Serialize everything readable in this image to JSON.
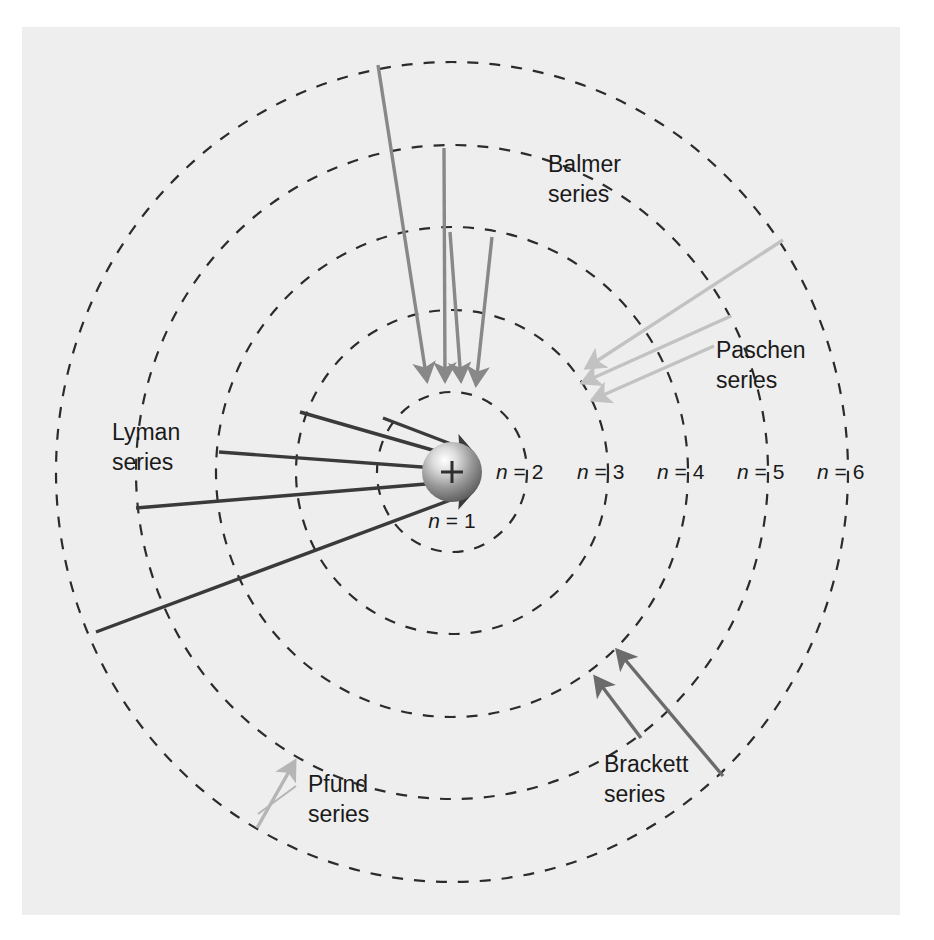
{
  "figure": {
    "background_color": "#eeeeee",
    "page_color": "#ffffff"
  },
  "nucleus": {
    "symbol": "+",
    "label": "n = 1",
    "center_x": 452,
    "center_y": 472,
    "radius": 30,
    "fill_dark": "#6e6e6e",
    "fill_light": "#f2f2f2"
  },
  "orbits": [
    {
      "n": 2,
      "label": "n = 2",
      "rx": 75,
      "ry": 80,
      "label_x": 496,
      "label_y": 479
    },
    {
      "n": 3,
      "label": "n = 3",
      "rx": 156,
      "ry": 162,
      "label_x": 577,
      "label_y": 479
    },
    {
      "n": 4,
      "label": "n = 4",
      "rx": 236,
      "ry": 245,
      "label_x": 657,
      "label_y": 479
    },
    {
      "n": 5,
      "label": "n = 5",
      "rx": 316,
      "ry": 327,
      "label_x": 737,
      "label_y": 479
    },
    {
      "n": 6,
      "label": "n = 6",
      "rx": 396,
      "ry": 410,
      "label_x": 817,
      "label_y": 479
    }
  ],
  "orbit_style": {
    "stroke": "#2b2b2b",
    "stroke_width": 2.2,
    "dash": "11 11"
  },
  "series": [
    {
      "key": "lyman",
      "name": "Lyman\nseries",
      "name_line1": "Lyman",
      "name_line2": "series",
      "final_level": 1,
      "from_levels": [
        2,
        3,
        4,
        5,
        6
      ],
      "arrow_color": "#3a3a3a",
      "label_x": 112,
      "label_y": 440
    },
    {
      "key": "balmer",
      "name": "Balmer\nseries",
      "name_line1": "Balmer",
      "name_line2": "series",
      "final_level": 2,
      "from_levels": [
        3,
        4,
        5,
        6
      ],
      "arrow_color": "#888888",
      "label_x": 548,
      "label_y": 172
    },
    {
      "key": "paschen",
      "name": "Paschen\nseries",
      "name_line1": "Paschen",
      "name_line2": "series",
      "final_level": 3,
      "from_levels": [
        4,
        5,
        6
      ],
      "arrow_color": "#c2c2c2",
      "label_x": 716,
      "label_y": 358
    },
    {
      "key": "brackett",
      "name": "Brackett\nseries",
      "name_line1": "Brackett",
      "name_line2": "series",
      "final_level": 4,
      "from_levels": [
        5,
        6
      ],
      "arrow_color": "#6b6b6b",
      "label_x": 604,
      "label_y": 772
    },
    {
      "key": "pfund",
      "name": "Pfund\nseries",
      "name_line1": "Pfund",
      "name_line2": "series",
      "final_level": 5,
      "from_levels": [
        6
      ],
      "arrow_color": "#b5b5b5",
      "label_x": 308,
      "label_y": 792
    }
  ],
  "leader_lines": [
    {
      "name": "balmer-leader",
      "x1": 649,
      "y1": 186,
      "x2": 700,
      "y2": 218
    },
    {
      "name": "pfund-leader",
      "x1": 296,
      "y1": 785,
      "x2": 257,
      "y2": 812
    }
  ]
}
